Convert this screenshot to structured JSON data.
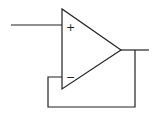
{
  "diagram": {
    "type": "op-amp voltage follower",
    "component": "operational-amplifier",
    "inputs": {
      "non_inverting": {
        "symbol": "+"
      },
      "inverting": {
        "symbol": "−"
      }
    },
    "connections": [
      "external input to non-inverting (+) input",
      "output fed back to inverting (−) input",
      "output terminal to the right"
    ],
    "colors": {
      "line": "#222222",
      "background": "#ffffff"
    }
  }
}
